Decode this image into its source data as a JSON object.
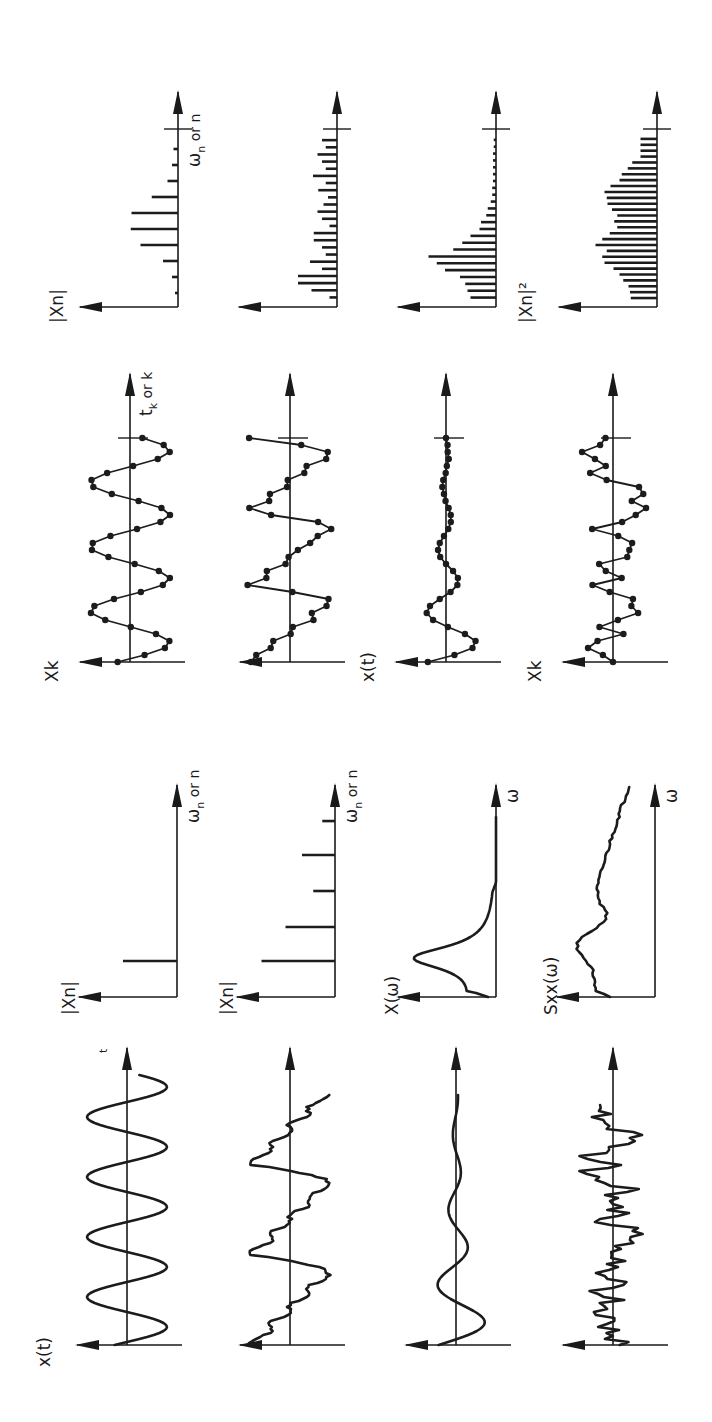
{
  "figure": {
    "orientation": "rotated 90 degrees counter-clockwise",
    "columns": [
      "time history",
      "continuous spectrum",
      "sampled sequence",
      "discrete (DFT) spectrum"
    ],
    "rows": [
      {
        "name": "periodic-sine",
        "time_history": {
          "ylabel": "x(t)",
          "xlabel": "t",
          "shape": "pure sine",
          "cycles": 4.5
        },
        "spectrum": {
          "ylabel": "|Xn|",
          "xlabel_main": "ω",
          "xlabel_sub": "n",
          "xlabel_tail": "or n",
          "type": "line",
          "lines": [
            {
              "pos": 0.17,
              "height": 0.72
            }
          ]
        },
        "sampled": {
          "ylabel": "Xk",
          "xlabel_main": "t",
          "xlabel_sub": "k",
          "xlabel_tail": "or k",
          "shape": "sampled sine"
        },
        "dft": {
          "ylabel": "|Xn|",
          "xlabel_main": "ω",
          "xlabel_sub": "n",
          "xlabel_tail": "or n",
          "bars": [
            0.04,
            0.08,
            0.2,
            0.5,
            0.63,
            0.62,
            0.35,
            0.14,
            0.08,
            0.06
          ]
        }
      },
      {
        "name": "complex-periodic",
        "time_history": {
          "ylabel": "",
          "xlabel": "",
          "shape": "periodic with harmonics"
        },
        "spectrum": {
          "ylabel": "|Xn|",
          "xlabel_main": "ω",
          "xlabel_sub": "n",
          "xlabel_tail": "or n",
          "type": "line",
          "lines": [
            {
              "pos": 0.17,
              "height": 0.98
            },
            {
              "pos": 0.33,
              "height": 0.66
            },
            {
              "pos": 0.5,
              "height": 0.29
            },
            {
              "pos": 0.67,
              "height": 0.44
            },
            {
              "pos": 0.83,
              "height": 0.17
            }
          ]
        },
        "sampled": {
          "ylabel": "",
          "shape": "sampled complex periodic"
        },
        "dft": {
          "ylabel": "",
          "bars": [
            0.1,
            0.34,
            0.52,
            0.52,
            0.2,
            0.36,
            0.15,
            0.2,
            0.31,
            0.31,
            0.1,
            0.2,
            0.26,
            0.18,
            0.12,
            0.25,
            0.15,
            0.32,
            0.15,
            0.2,
            0.26,
            0.15,
            0.2
          ]
        }
      },
      {
        "name": "transient",
        "time_history": {
          "ylabel": "",
          "shape": "decaying oscillation"
        },
        "spectrum": {
          "ylabel": "X(ω)",
          "xlabel_main": "ω",
          "type": "continuous",
          "shape": "resonance peak"
        },
        "sampled": {
          "ylabel": "x(t)",
          "shape": "sampled decaying oscillation"
        },
        "dft": {
          "ylabel": "",
          "bars": [
            0.34,
            0.38,
            0.41,
            0.48,
            0.68,
            0.79,
            0.9,
            0.57,
            0.45,
            0.34,
            0.22,
            0.2,
            0.13,
            0.11,
            0.07,
            0.05,
            0.05,
            0.04,
            0.04,
            0.04,
            0.04,
            0.04,
            0.03,
            0.03
          ]
        }
      },
      {
        "name": "random",
        "time_history": {
          "ylabel": "",
          "shape": "random signal"
        },
        "spectrum": {
          "ylabel": "Sxx(ω)",
          "xlabel_main": "ω",
          "type": "continuous",
          "shape": "broadband PSD"
        },
        "sampled": {
          "ylabel": "Xk",
          "shape": "sampled random signal"
        },
        "dft": {
          "ylabel": "|Xn|²",
          "bars": [
            0.35,
            0.36,
            0.38,
            0.45,
            0.5,
            0.58,
            0.7,
            0.73,
            0.67,
            0.82,
            0.73,
            0.63,
            0.53,
            0.57,
            0.53,
            0.6,
            0.66,
            0.67,
            0.7,
            0.62,
            0.5,
            0.47,
            0.39,
            0.33,
            0.22,
            0.22,
            0.22,
            0.22
          ]
        }
      }
    ]
  }
}
